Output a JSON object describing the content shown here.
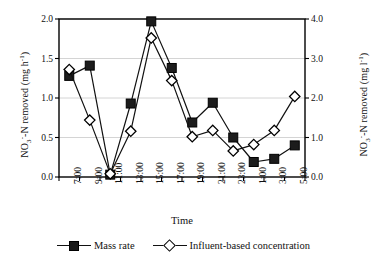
{
  "chart_data": {
    "type": "line",
    "title": "",
    "xlabel": "Time",
    "ylabel": "NO3--N removed (mg h-1)",
    "ylabel_right": "NO3--N removed (mg l-1)",
    "categories": [
      "7:00",
      "9:00",
      "11:00",
      "13:00",
      "15:00",
      "17:00",
      "19:00",
      "21:00",
      "23:00",
      "1:00",
      "3:00",
      "5:00"
    ],
    "ylim": [
      0.0,
      2.0
    ],
    "ylim_right": [
      0.0,
      4.0
    ],
    "yticks": [
      "0.0",
      "0.5",
      "1.0",
      "1.5",
      "2.0"
    ],
    "yticks_right": [
      "0.0",
      "1.0",
      "2.0",
      "3.0",
      "4.0"
    ],
    "grid": true,
    "legend_position": "bottom",
    "series": [
      {
        "name": "Mass rate",
        "axis": "left",
        "marker": "filled-square",
        "values": [
          1.28,
          1.41,
          0.03,
          0.93,
          1.97,
          1.38,
          0.69,
          0.94,
          0.5,
          0.19,
          0.23,
          0.4
        ]
      },
      {
        "name": "Influent-based concentration",
        "axis": "right",
        "marker": "open-diamond",
        "values": [
          2.72,
          1.44,
          0.08,
          1.16,
          3.52,
          2.44,
          1.02,
          1.18,
          0.66,
          0.82,
          1.18,
          2.04
        ]
      }
    ]
  },
  "axes": {
    "left_title_main": "NO",
    "left_title_sub": "3",
    "left_title_sup": "-",
    "left_title_rest": "-N removed (mg h",
    "left_title_exp": "-1",
    "left_title_close": ")",
    "right_title_main": "NO",
    "right_title_sub": "3",
    "right_title_sup": "-",
    "right_title_rest": "-N removed (mg l",
    "right_title_exp": "-1",
    "right_title_close": ")",
    "x_title": "Time"
  },
  "legend": {
    "items": [
      {
        "label": "Mass rate",
        "marker": "filled-square"
      },
      {
        "label": "Influent-based concentration",
        "marker": "open-diamond"
      }
    ]
  }
}
